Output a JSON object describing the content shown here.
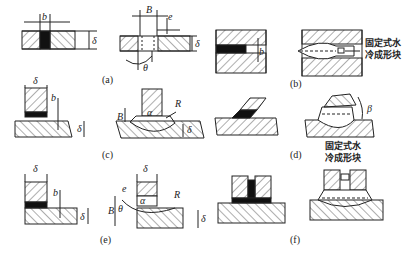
{
  "figure": {
    "panels": [
      {
        "id": "a",
        "label": "(a)",
        "symbols": [
          "b",
          "B",
          "e",
          "δ",
          "θ"
        ]
      },
      {
        "id": "b",
        "label": "(b)",
        "symbols": [
          "b"
        ],
        "annotation": [
          "固定式水",
          "冷成形块"
        ]
      },
      {
        "id": "c",
        "label": "(c)",
        "symbols": [
          "δ",
          "b",
          "B",
          "α",
          "R"
        ]
      },
      {
        "id": "d",
        "label": "(d)",
        "symbols": [
          "β"
        ]
      },
      {
        "id": "e",
        "label": "(e)",
        "symbols": [
          "δ",
          "b",
          "e",
          "B",
          "θ",
          "α",
          "R"
        ]
      },
      {
        "id": "f",
        "label": "(f)",
        "annotation": [
          "固定式水",
          "冷成形块"
        ]
      }
    ],
    "sym": {
      "b": "b",
      "B": "B",
      "e": "e",
      "delta": "δ",
      "theta": "θ",
      "alpha": "α",
      "R": "R",
      "beta": "β"
    },
    "annot1": "固定式水",
    "annot2": "冷成形块"
  }
}
